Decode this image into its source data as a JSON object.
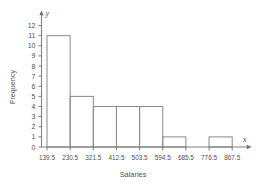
{
  "chart_data": {
    "type": "bar",
    "title": "",
    "xlabel": "Salaries",
    "ylabel": "Frequency",
    "x_axis_variable": "x",
    "y_axis_variable": "y",
    "grid": false,
    "legend": "none",
    "bin_edges": [
      139.5,
      230.5,
      321.5,
      412.5,
      503.5,
      594.5,
      685.5,
      776.5,
      867.5
    ],
    "bin_labels": [
      "139.5",
      "230.5",
      "321.5",
      "412.5",
      "503.5",
      "594.5",
      "685.5",
      "776.5",
      "867.5"
    ],
    "categories": [
      "139.5-230.5",
      "230.5-321.5",
      "321.5-412.5",
      "412.5-503.5",
      "503.5-594.5",
      "594.5-685.5",
      "685.5-776.5",
      "776.5-867.5"
    ],
    "values": [
      11,
      5,
      4,
      4,
      4,
      1,
      0,
      1
    ],
    "ylim": [
      0,
      12
    ],
    "ytick_labels": [
      "0",
      "1",
      "2",
      "3",
      "4",
      "5",
      "6",
      "7",
      "8",
      "9",
      "10",
      "11",
      "12"
    ],
    "ytick_values": [
      0,
      1,
      2,
      3,
      4,
      5,
      6,
      7,
      8,
      9,
      10,
      11,
      12
    ],
    "xlim": [
      139.5,
      867.5
    ]
  },
  "colors": {
    "background": "#ffffff",
    "axis": "#6f6f6f",
    "bar_stroke": "#8a8a8a",
    "text": "#4f4f4f"
  }
}
